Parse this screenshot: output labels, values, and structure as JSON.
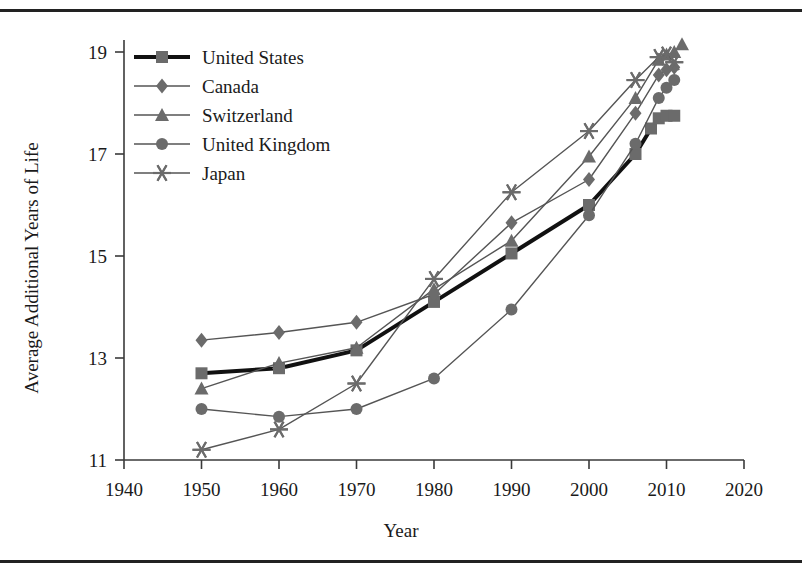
{
  "chart_data": {
    "type": "line",
    "title": "",
    "xlabel": "Year",
    "ylabel": "Average Additional Years of Life",
    "xlim": [
      1940,
      2020
    ],
    "ylim": [
      11,
      19
    ],
    "xticks": [
      1940,
      1950,
      1960,
      1970,
      1980,
      1990,
      2000,
      2010,
      2020
    ],
    "yticks": [
      11,
      13,
      15,
      17,
      19
    ],
    "grid": false,
    "legend_position": "top-left-inside",
    "series": [
      {
        "name": "United States",
        "marker": "square",
        "color": "#6b6b6b",
        "line_color": "#111111",
        "line_width": 4.0,
        "x": [
          1950,
          1960,
          1970,
          1980,
          1990,
          2000,
          2006,
          2008,
          2009,
          2010,
          2011
        ],
        "y": [
          12.7,
          12.8,
          13.15,
          14.1,
          15.05,
          16.0,
          17.0,
          17.5,
          17.7,
          17.75,
          17.75
        ]
      },
      {
        "name": "Canada",
        "marker": "diamond",
        "color": "#6b6b6b",
        "line_color": "#555555",
        "line_width": 1.4,
        "x": [
          1950,
          1960,
          1970,
          1980,
          1990,
          2000,
          2006,
          2009,
          2010,
          2011
        ],
        "y": [
          13.35,
          13.5,
          13.7,
          14.25,
          15.65,
          16.5,
          17.8,
          18.55,
          18.65,
          18.7
        ]
      },
      {
        "name": "Switzerland",
        "marker": "triangle",
        "color": "#6b6b6b",
        "line_color": "#555555",
        "line_width": 1.4,
        "x": [
          1950,
          1960,
          1970,
          1980,
          1990,
          2000,
          2006,
          2009,
          2010,
          2011,
          2012
        ],
        "y": [
          12.4,
          12.9,
          13.2,
          14.35,
          15.3,
          16.95,
          18.1,
          18.85,
          18.95,
          19.0,
          19.15
        ]
      },
      {
        "name": "United Kingdom",
        "marker": "circle",
        "color": "#6b6b6b",
        "line_color": "#555555",
        "line_width": 1.4,
        "x": [
          1950,
          1960,
          1970,
          1980,
          1990,
          2000,
          2006,
          2009,
          2010,
          2011
        ],
        "y": [
          12.0,
          11.85,
          12.0,
          12.6,
          13.95,
          15.8,
          17.2,
          18.1,
          18.3,
          18.45
        ]
      },
      {
        "name": "Japan",
        "marker": "asterisk",
        "color": "#6b6b6b",
        "line_color": "#555555",
        "line_width": 1.4,
        "x": [
          1950,
          1960,
          1970,
          1980,
          1990,
          2000,
          2006,
          2009,
          2010,
          2011
        ],
        "y": [
          11.2,
          11.6,
          12.5,
          14.55,
          16.25,
          17.45,
          18.45,
          18.9,
          18.95,
          18.8
        ]
      }
    ]
  },
  "legend": {
    "entries": [
      {
        "label": "United States"
      },
      {
        "label": "Canada"
      },
      {
        "label": "Switzerland"
      },
      {
        "label": "United Kingdom"
      },
      {
        "label": "Japan"
      }
    ]
  },
  "axes": {
    "x_tick_labels": [
      "1940",
      "1950",
      "1960",
      "1970",
      "1980",
      "1990",
      "2000",
      "2010",
      "2020"
    ],
    "y_tick_labels": [
      "11",
      "13",
      "15",
      "17",
      "19"
    ],
    "x_title": "Year",
    "y_title": "Average Additional Years of Life"
  },
  "colors": {
    "axis": "#3a3a3a",
    "marker": "#6b6b6b",
    "line": "#555555",
    "emphasis_line": "#111111",
    "rule": "#222222",
    "text": "#1a1a1a"
  }
}
